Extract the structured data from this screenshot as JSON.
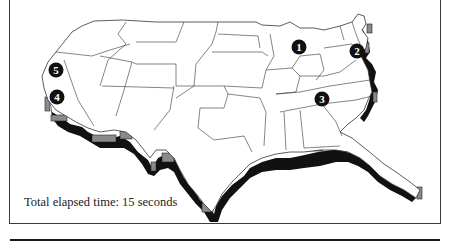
{
  "figure": {
    "caption": "Total elapsed time: 15 seconds",
    "map_subject": "Continental United States with extruded coastline",
    "colors": {
      "outline": "#333333",
      "extrusion_dark": "#111111",
      "extrusion_face": "#8a8a8a",
      "marker_fill": "#111111",
      "marker_text": "#ffffff"
    },
    "markers": [
      {
        "label": "1",
        "x": 299,
        "y": 47
      },
      {
        "label": "2",
        "x": 357,
        "y": 51
      },
      {
        "label": "3",
        "x": 322,
        "y": 99
      },
      {
        "label": "4",
        "x": 57,
        "y": 97
      },
      {
        "label": "5",
        "x": 56,
        "y": 70
      }
    ]
  }
}
